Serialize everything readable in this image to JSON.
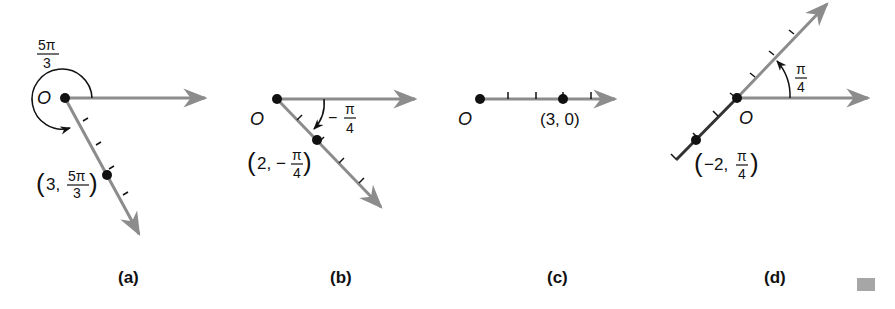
{
  "colors": {
    "ray": "#8c8c8c",
    "ink": "#111111",
    "marker": "#a6a6a6"
  },
  "panels": [
    {
      "id": "a",
      "caption": "(a)",
      "origin_label": "O",
      "angle_label_num": "5π",
      "angle_label_den": "3",
      "point_label_r": "3,",
      "point_label_num": "5π",
      "point_label_den": "3",
      "point": "(3, 5π/3)"
    },
    {
      "id": "b",
      "caption": "(b)",
      "origin_label": "O",
      "angle_label_sign": "−",
      "angle_label_num": "π",
      "angle_label_den": "4",
      "point_label_r": "2, −",
      "point_label_num": "π",
      "point_label_den": "4",
      "point": "(2, −π/4)"
    },
    {
      "id": "c",
      "caption": "(c)",
      "origin_label": "O",
      "point_label": "(3, 0)",
      "point": "(3, 0)"
    },
    {
      "id": "d",
      "caption": "(d)",
      "origin_label": "O",
      "angle_label_num": "π",
      "angle_label_den": "4",
      "point_label_r": "−2,",
      "point_label_num": "π",
      "point_label_den": "4",
      "point": "(−2, π/4)"
    }
  ]
}
